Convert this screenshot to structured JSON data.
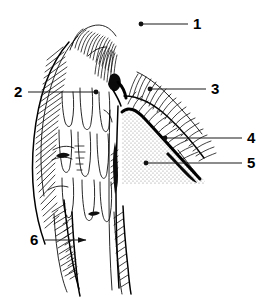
{
  "figure": {
    "style": "black-and-white pen-and-ink sectional illustration",
    "background_color": "#ffffff",
    "ink_color": "#000000",
    "stipple_color": "#9a9a9a",
    "callouts": [
      {
        "id": "callout-1",
        "label": "1",
        "label_x": 196,
        "label_y": 26,
        "line_x1": 141,
        "line_y1": 24,
        "line_x2": 188,
        "line_y2": 24,
        "marker": "dot",
        "marker_end": "start"
      },
      {
        "id": "callout-2",
        "label": "2",
        "label_x": 15,
        "label_y": 92,
        "line_x1": 28,
        "line_y1": 92,
        "line_x2": 96,
        "line_y2": 92,
        "marker": "dot",
        "marker_end": "end"
      },
      {
        "id": "callout-3",
        "label": "3",
        "label_x": 213,
        "label_y": 89,
        "line_x1": 150,
        "line_y1": 89,
        "line_x2": 206,
        "line_y2": 89,
        "marker": "dot",
        "marker_end": "start"
      },
      {
        "id": "callout-4",
        "label": "4",
        "label_x": 249,
        "label_y": 138,
        "line_x1": 165,
        "line_y1": 138,
        "line_x2": 242,
        "line_y2": 138,
        "marker": "dot",
        "marker_end": "start"
      },
      {
        "id": "callout-5",
        "label": "5",
        "label_x": 249,
        "label_y": 163,
        "line_x1": 146,
        "line_y1": 163,
        "line_x2": 242,
        "line_y2": 163,
        "marker": "dot",
        "marker_end": "start"
      },
      {
        "id": "callout-6",
        "label": "6",
        "label_x": 32,
        "label_y": 240,
        "line_x1": 45,
        "line_y1": 240,
        "line_x2": 88,
        "line_y2": 240,
        "marker": "arrow",
        "marker_end": "end"
      }
    ],
    "regions": [
      {
        "id": "stipple-region",
        "name": "stippled-triangular-region",
        "fill": "#9a9a9a",
        "description": "light stippled wedge bounded above-right by a heavy dark line"
      },
      {
        "id": "hatched-left-mass",
        "name": "hatched-tissue-mass",
        "description": "dense oblique hatching forming the left body of the section"
      },
      {
        "id": "comb-hatching-right",
        "name": "comb-hatched-flap",
        "description": "dense comb-like short strokes along the descending right diagonal"
      },
      {
        "id": "dark-tapered-probe",
        "name": "dark-tapered-tip",
        "description": "solid black tapering stroke angled down to the right"
      }
    ]
  }
}
